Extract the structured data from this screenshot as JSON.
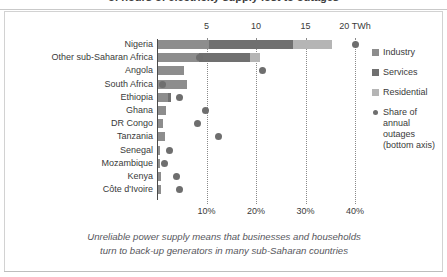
{
  "title": "of hours of electricity supply lost to outages",
  "caption_line1": "Unreliable power supply means that businesses and households",
  "caption_line2": "turn to back-up generators in many sub-Saharan countries",
  "legend": {
    "items": [
      {
        "label": "Industry",
        "color": "#8d8d8d",
        "shape": "square"
      },
      {
        "label": "Services",
        "color": "#707070",
        "shape": "square"
      },
      {
        "label": "Residential",
        "color": "#b5b5b5",
        "shape": "square"
      },
      {
        "label": "Share of",
        "label2": "annual outages",
        "label3": "(bottom axis)",
        "color": "#6e6e6e",
        "shape": "circle"
      }
    ]
  },
  "chart_data": {
    "type": "bar",
    "title": "of hours of electricity supply lost to outages",
    "orientation": "horizontal",
    "stacked": true,
    "grid": true,
    "legend_position": "right",
    "categories": [
      "Nigeria",
      "Other sub-Saharan Africa",
      "Angola",
      "South Africa",
      "Ethiopia",
      "Ghana",
      "DR Congo",
      "Tanzania",
      "Senegal",
      "Mozambique",
      "Kenya",
      "Côte d'Ivoire"
    ],
    "xlabel_top": "TWh",
    "top_axis_ticks": [
      "5",
      "10",
      "15",
      "20 TWh"
    ],
    "top_axis_values": [
      5,
      10,
      15,
      20
    ],
    "top_axis_range": [
      0,
      22
    ],
    "xlabel_bottom": "Share of annual outages",
    "bottom_axis_ticks": [
      "10%",
      "20%",
      "30%",
      "40%"
    ],
    "bottom_axis_values": [
      10,
      20,
      30,
      40
    ],
    "bottom_axis_range": [
      0,
      44
    ],
    "series": [
      {
        "name": "Industry",
        "color": "#8d8d8d",
        "values": [
          5.2,
          4.1,
          2.6,
          2.9,
          1.0,
          0.8,
          0.5,
          0.7,
          0.25,
          0.2,
          0.3,
          0.3
        ]
      },
      {
        "name": "Services",
        "color": "#707070",
        "values": [
          8.4,
          5.2,
          0.0,
          0.0,
          0.35,
          0.0,
          0.0,
          0.0,
          0.0,
          0.0,
          0.0,
          0.0
        ]
      },
      {
        "name": "Residential",
        "color": "#b5b5b5",
        "values": [
          4.0,
          1.0,
          0.0,
          0.0,
          0.0,
          0.0,
          0.0,
          0.0,
          0.0,
          0.0,
          0.0,
          0.0
        ]
      }
    ],
    "outage_share": {
      "name": "Share of annual outages (bottom axis)",
      "color": "#6e6e6e",
      "unit": "%",
      "values": [
        40.2,
        8.6,
        21.3,
        1.2,
        4.6,
        9.7,
        8.1,
        12.4,
        2.5,
        1.6,
        4.0,
        4.5
      ]
    }
  }
}
